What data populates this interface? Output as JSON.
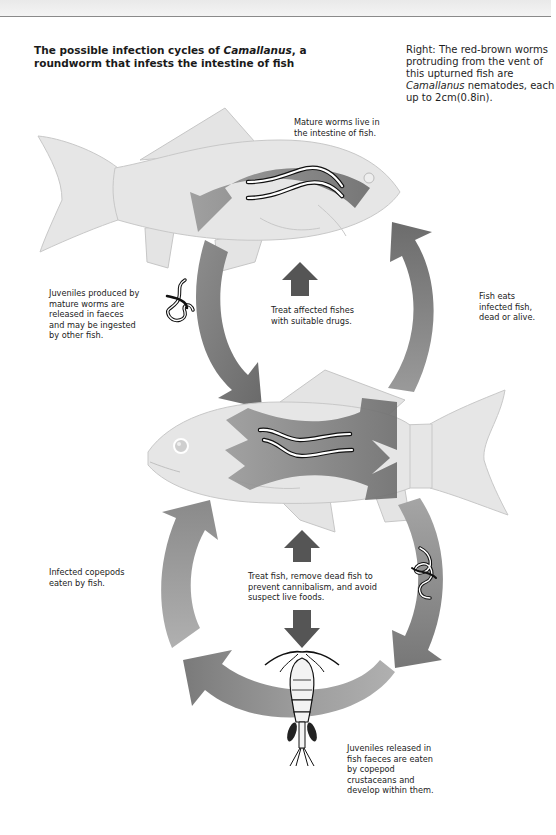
{
  "header": {
    "title_part1": "The possible infection cycles of ",
    "title_italic": "Camallanus",
    "title_part2": ", a roundworm that infests the intestine of fish"
  },
  "caption": {
    "part1": "Right: The red-brown worms protruding from the vent of this upturned fish are ",
    "italic": "Camallanus",
    "part2": " nematodes, each up to 2cm(0.8in)."
  },
  "labels": {
    "mature_worms": "Mature worms live in the intestine of fish.",
    "juveniles_produced": "Juveniles produced by mature worms are released in faeces and may be ingested by other fish.",
    "treat_drugs": "Treat affected fishes with suitable drugs.",
    "fish_eats": "Fish eats infected fish, dead or alive.",
    "infected_copepods": "Infected copepods eaten by fish.",
    "treat_remove": "Treat fish, remove dead fish to prevent cannibalism, and avoid suspect live foods.",
    "juveniles_released": "Juveniles released in fish faeces are eaten by copepod crustaceans and develop within them."
  },
  "colors": {
    "fish_fill": "#e6e6e6",
    "fish_outline": "#c4c4c4",
    "arrow_dark": "#6e6e6e",
    "arrow_mid": "#8c8c8c",
    "arrow_light": "#a8a8a8",
    "treatment_arrow": "#555555"
  },
  "icons": {
    "top_fish": "fish-illustration",
    "middle_fish": "fish-illustration",
    "worms": "nematode-worm-illustration",
    "juvenile_worms": "juvenile-worm-illustration",
    "copepod": "copepod-crustacean-illustration",
    "treatment_arrows": "arrow-up-icon"
  }
}
